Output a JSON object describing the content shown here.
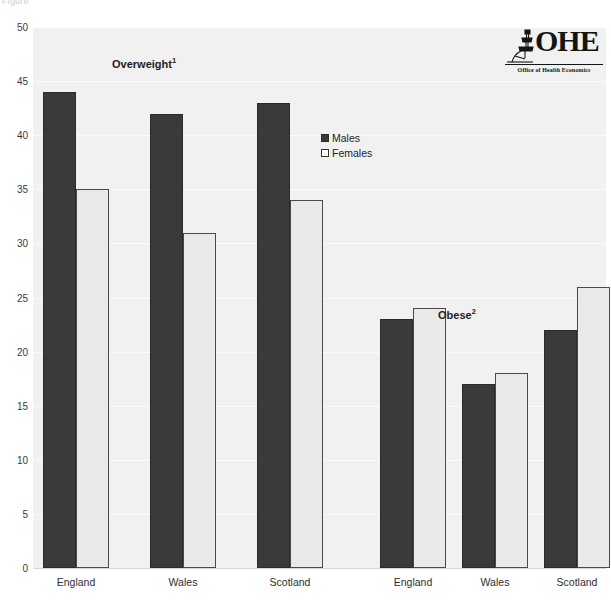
{
  "top_caption": "Figure",
  "logo": {
    "mark_name": "ohe-microscope-mark",
    "wordmark": "OHE",
    "tagline": "Office of Health Economics"
  },
  "legend": {
    "position": "inside-upper-center",
    "items": [
      {
        "label": "Males",
        "color": "#3a3a3a",
        "swatch": "filled-square"
      },
      {
        "label": "Females",
        "color": "#ffffff",
        "swatch": "open-square"
      }
    ]
  },
  "annotations": [
    {
      "name": "overweight-annotation",
      "text": "Overweight",
      "sup": "1",
      "x": 112,
      "y": 56
    },
    {
      "name": "obese-annotation",
      "text": "Obese",
      "sup": "2",
      "x": 438,
      "y": 307
    }
  ],
  "colors": {
    "males": "#3a3a3a",
    "females": "#e9e9e9",
    "females_border": "#4a4a4a",
    "plot_background": "#f1f1f1",
    "gridline": "#fbfbfb",
    "axis": "#d6d6d6",
    "text": "#2e2e2e"
  },
  "chart_data": {
    "type": "bar",
    "title": "",
    "subtitle": "",
    "xlabel": "",
    "ylabel": "",
    "ylim": [
      0,
      50
    ],
    "yticks": [
      0,
      5,
      10,
      15,
      20,
      25,
      30,
      35,
      40,
      45,
      50
    ],
    "ytick_labels": [
      "0",
      "5",
      "10",
      "15",
      "20",
      "25",
      "30",
      "35",
      "40",
      "45",
      "50"
    ],
    "grid": true,
    "grid_axis": "y",
    "legend_entries": [
      "Males",
      "Females"
    ],
    "groups": [
      {
        "section": "Overweight",
        "section_sup": "1",
        "categories": [
          "England",
          "Wales",
          "Scotland"
        ],
        "series": [
          {
            "name": "Males",
            "values": [
              44,
              42,
              43
            ]
          },
          {
            "name": "Females",
            "values": [
              35,
              31,
              34
            ]
          }
        ]
      },
      {
        "section": "Obese",
        "section_sup": "2",
        "categories": [
          "England",
          "Wales",
          "Scotland"
        ],
        "series": [
          {
            "name": "Males",
            "values": [
              23,
              17,
              22
            ]
          },
          {
            "name": "Females",
            "values": [
              24,
              18,
              26
            ]
          }
        ]
      }
    ],
    "categories": [
      "England",
      "Wales",
      "Scotland",
      "England",
      "Wales",
      "Scotland"
    ],
    "bars": [
      {
        "section": "Overweight",
        "category": "England",
        "series": "Males",
        "value": 44
      },
      {
        "section": "Overweight",
        "category": "England",
        "series": "Females",
        "value": 35
      },
      {
        "section": "Overweight",
        "category": "Wales",
        "series": "Males",
        "value": 42
      },
      {
        "section": "Overweight",
        "category": "Wales",
        "series": "Females",
        "value": 31
      },
      {
        "section": "Overweight",
        "category": "Scotland",
        "series": "Males",
        "value": 43
      },
      {
        "section": "Overweight",
        "category": "Scotland",
        "series": "Females",
        "value": 34
      },
      {
        "section": "Obese",
        "category": "England",
        "series": "Males",
        "value": 23
      },
      {
        "section": "Obese",
        "category": "England",
        "series": "Females",
        "value": 24
      },
      {
        "section": "Obese",
        "category": "Wales",
        "series": "Males",
        "value": 17
      },
      {
        "section": "Obese",
        "category": "Wales",
        "series": "Females",
        "value": 18
      },
      {
        "section": "Obese",
        "category": "Scotland",
        "series": "Males",
        "value": 22
      },
      {
        "section": "Obese",
        "category": "Scotland",
        "series": "Females",
        "value": 26
      }
    ],
    "bar_slots": [
      {
        "x": 43,
        "label_x": 76,
        "label": "England"
      },
      {
        "x": 150,
        "label_x": 183,
        "label": "Wales"
      },
      {
        "x": 257,
        "label_x": 290,
        "label": "Scotland"
      },
      {
        "x": 380,
        "label_x": 413,
        "label": "England"
      },
      {
        "x": 462,
        "label_x": 495,
        "label": "Wales"
      },
      {
        "x": 544,
        "label_x": 577,
        "label": "Scotland"
      }
    ],
    "bar_width": 33
  }
}
